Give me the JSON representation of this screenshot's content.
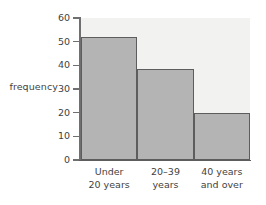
{
  "chart_data": {
    "type": "bar",
    "title": "",
    "subtitle": "",
    "xlabel": "",
    "ylabel": "frequency",
    "categories": [
      "Under 20 years",
      "20–39 years",
      "40 years and over"
    ],
    "category_lines": [
      [
        "Under",
        "20 years"
      ],
      [
        "20–39",
        "years"
      ],
      [
        "40 years",
        "and over"
      ]
    ],
    "values": [
      52,
      38.5,
      20
    ],
    "ylim": [
      0,
      60
    ],
    "y_ticks": [
      0,
      10,
      20,
      30,
      40,
      50,
      60
    ],
    "y_tick_labels": [
      "0",
      "10",
      "20",
      "30",
      "40",
      "50",
      "60"
    ],
    "grid": false,
    "legend": "none",
    "bar_style": "histogram-contiguous",
    "colors": {
      "bar_fill": "#b4b4b4",
      "bar_outline": "#5d5d5d",
      "panel_background": "#f2f2f0",
      "axis": "#6f6f6f",
      "text": "#3f3f3f",
      "page_background": "#ffffff"
    }
  }
}
